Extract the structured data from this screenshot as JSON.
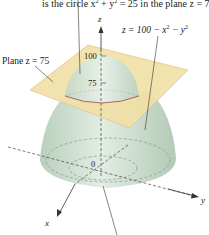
{
  "caption_fragment": "is the circle x² + y² = 25 in the plane z = 75.",
  "caption_top": "is the circle x",
  "caption_sup1": "2",
  "caption_mid": " + y",
  "caption_sup2": "2",
  "caption_end": " = 25 in the plane z = 75.",
  "surface_label": {
    "prefix": "z = 100 − x",
    "sup1": "2",
    "mid": " − y",
    "sup2": "2"
  },
  "plane_label": "Plane z = 75",
  "axes": {
    "z": "z",
    "x": "x",
    "y": "y",
    "origin": "0"
  },
  "ticks": {
    "top": "100",
    "mid": "75"
  },
  "colors": {
    "plane": "#f0dca0",
    "plane_edge": "#d9c27a",
    "surface": "#c8dccb",
    "surface_dark": "#b5ccb8",
    "intersection": "#b0655a",
    "axis": "#333333"
  }
}
